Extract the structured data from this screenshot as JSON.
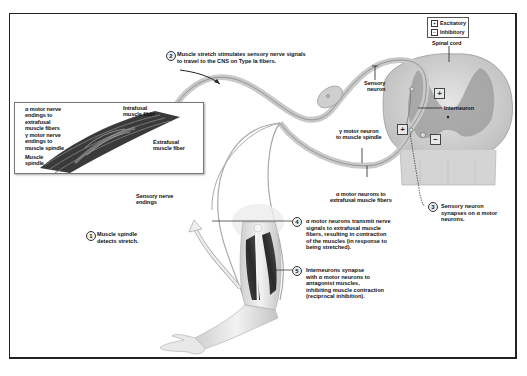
{
  "legend": {
    "items": [
      {
        "symbol": "⊞",
        "label": "Excitatory"
      },
      {
        "symbol": "⊟",
        "label": "Inhibitory"
      }
    ]
  },
  "labels": {
    "spinal_cord": "Spinal cord",
    "sensory_neuron": "Sensory\nneuron",
    "interneuron": "Interneuron",
    "gamma_motor_neuron": "γ motor neuron\nto muscle spindle",
    "alpha_motor_neurons": "α motor neurons to\nextrafusal muscle fibers",
    "alpha_motor_endings": "α motor nerve\nendings to\nextrafusal\nmuscle fibers",
    "gamma_motor_endings": "γ motor nerve\nendings to\nmuscle spindle",
    "muscle_spindle": "Muscle\nspindle",
    "intrafusal_fiber": "Intrafusal\nmuscle fiber",
    "extrafusal_fiber": "Extrafusal\nmuscle fiber",
    "sensory_endings": "Sensory nerve\nendings"
  },
  "signs": {
    "plus": "+",
    "minus": "−"
  },
  "steps": [
    {
      "num": "1",
      "text": "Muscle spindle\ndetects stretch."
    },
    {
      "num": "2",
      "text": "Muscle stretch stimulates sensory nerve signals\nto travel to the CNS on Type Ia fibers."
    },
    {
      "num": "3",
      "text": "Sensory neuron\nsynapses on α motor\nneurons."
    },
    {
      "num": "4",
      "text": "α motor neurons transmit nerve\nsignals to extrafusal muscle\nfibers, resulting in contraction\nof the muscles (in response to\nbeing stretched)."
    },
    {
      "num": "5",
      "text": "Interneurons synapse\nwith α motor neurons to\nantagonist muscles,\ninhibiting muscle contraction\n(reciprocal inhibition)."
    }
  ]
}
